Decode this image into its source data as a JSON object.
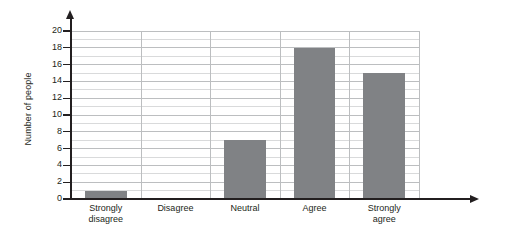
{
  "chart_data": {
    "type": "bar",
    "title": "",
    "xlabel": "",
    "ylabel": "Number of people",
    "categories": [
      "Strongly disagree",
      "Disagree",
      "Neutral",
      "Agree",
      "Strongly agree"
    ],
    "category_lines": [
      [
        "Strongly",
        "disagree"
      ],
      [
        "Disagree"
      ],
      [
        "Neutral"
      ],
      [
        "Agree"
      ],
      [
        "Strongly",
        "agree"
      ]
    ],
    "values": [
      1,
      0,
      7,
      18,
      15
    ],
    "ylim": [
      0,
      20
    ],
    "y_major_step": 2,
    "y_minor_step": 1,
    "y_tick_labels": [
      "0",
      "2",
      "4",
      "6",
      "8",
      "10",
      "12",
      "14",
      "16",
      "18",
      "20"
    ],
    "grid": "horizontal-and-vertical",
    "legend": "none",
    "bar_color": "#808285",
    "axis_color": "#231f20",
    "gridline_color": "#bcbec0",
    "minor_gridline_color": "#d9dadb",
    "background": "#ffffff"
  },
  "axes": {
    "y_arrow": "arrow-up-icon",
    "x_arrow": "arrow-right-icon"
  }
}
